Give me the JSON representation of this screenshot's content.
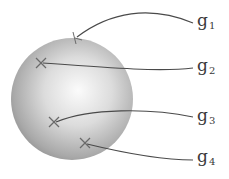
{
  "diagram": {
    "title": "",
    "sphere": {
      "cx": 72,
      "cy": 99,
      "r": 61,
      "highlight": {
        "cx": 78,
        "cy": 92
      },
      "colors": {
        "light": "#fafafa",
        "mid": "#c8c8c8",
        "dark": "#8c8c8c"
      }
    },
    "curve_color": "#4a4a4a",
    "marker_color": "#6a6a6a",
    "labels": [
      {
        "id": "g1",
        "base": "g",
        "sub": "1",
        "x": 197,
        "y": 12
      },
      {
        "id": "g2",
        "base": "g",
        "sub": "2",
        "x": 197,
        "y": 57
      },
      {
        "id": "g3",
        "base": "g",
        "sub": "3",
        "x": 197,
        "y": 110
      },
      {
        "id": "g4",
        "base": "g",
        "sub": "4",
        "x": 197,
        "y": 149
      }
    ],
    "points": [
      {
        "id": "g1",
        "x": 75,
        "y": 38,
        "marker": "tick-arrow",
        "path": "M 193 23 C 150 5, 110 12, 77 37"
      },
      {
        "id": "g2",
        "x": 41,
        "y": 63,
        "marker": "cross",
        "path": "M 193 68 C 160 72, 110 68, 43 63"
      },
      {
        "id": "g3",
        "x": 54,
        "y": 122,
        "marker": "cross",
        "path": "M 193 117 C 150 108, 90 108, 56 122"
      },
      {
        "id": "g4",
        "x": 85,
        "y": 143,
        "marker": "cross",
        "path": "M 193 160 C 160 160, 120 152, 87 144"
      }
    ]
  }
}
